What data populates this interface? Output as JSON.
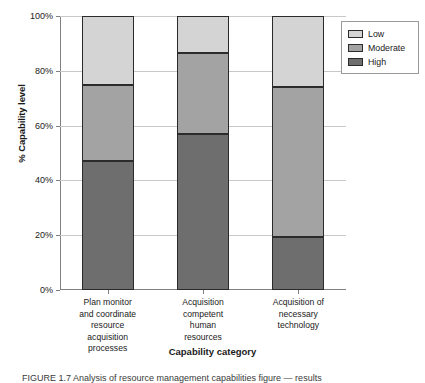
{
  "chart_data": {
    "type": "bar",
    "subtype": "stacked-100-percent",
    "title": "",
    "xlabel": "Capability category",
    "ylabel": "% Capability level",
    "ylim": [
      0,
      100
    ],
    "ytick_labels": [
      "0%",
      "20%",
      "40%",
      "60%",
      "80%",
      "100%"
    ],
    "ytick_values": [
      0,
      20,
      40,
      60,
      80,
      100
    ],
    "grid": true,
    "legend_position": "top-right",
    "categories": [
      "Plan monitor and coordinate resource acquisition processes",
      "Acquisition competent human resources",
      "Acquisition of necessary technology"
    ],
    "category_lines": [
      [
        "Plan monitor",
        "and coordinate",
        "resource",
        "acquisition",
        "processes"
      ],
      [
        "Acquisition",
        "competent",
        "human",
        "resources"
      ],
      [
        "Acquisition of",
        "necessary",
        "technology"
      ]
    ],
    "series": [
      {
        "name": "High",
        "color": "#6e6e6e",
        "values": [
          47.0,
          57.0,
          19.5
        ]
      },
      {
        "name": "Moderate",
        "color": "#a3a3a3",
        "values": [
          28.0,
          29.5,
          54.5
        ]
      },
      {
        "name": "Low",
        "color": "#d4d4d4",
        "values": [
          25.0,
          13.5,
          26.0
        ]
      }
    ],
    "stack_order_bottom_to_top": [
      "High",
      "Moderate",
      "Low"
    ]
  },
  "legend": {
    "items": [
      {
        "label": "Low",
        "color": "#d4d4d4"
      },
      {
        "label": "Moderate",
        "color": "#a3a3a3"
      },
      {
        "label": "High",
        "color": "#6e6e6e"
      }
    ]
  },
  "caption": {
    "text": "FIGURE 1.7   Analysis of resource management capabilities figure — results"
  }
}
